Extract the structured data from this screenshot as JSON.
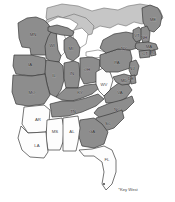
{
  "map": {
    "title": "Eastern United States shaded state map",
    "background_color": "#ffffff",
    "shaded_fill": "#8d8d8d",
    "unshaded_fill": "#fdfdfd",
    "neutral_fill": "#c6c6c6",
    "lake_fill": "#ffffff",
    "border_color": "#3a3a3a",
    "annotations": [
      {
        "id": "key-west",
        "text": "*Key West",
        "x": 128,
        "y": 190
      }
    ],
    "states": [
      {
        "id": "MN",
        "label": "MN",
        "shaded": true,
        "lx": 33,
        "ly": 35
      },
      {
        "id": "WI",
        "label": "WI",
        "shaded": true,
        "lx": 52,
        "ly": 46
      },
      {
        "id": "MI",
        "label": "MI",
        "shaded": true,
        "lx": 71,
        "ly": 49
      },
      {
        "id": "IA",
        "label": "IA",
        "shaded": true,
        "lx": 30,
        "ly": 65
      },
      {
        "id": "IL",
        "label": "IL",
        "shaded": true,
        "lx": 54,
        "ly": 76
      },
      {
        "id": "IN",
        "label": "IN",
        "shaded": true,
        "lx": 72,
        "ly": 74
      },
      {
        "id": "OH",
        "label": "OH",
        "shaded": true,
        "lx": 87,
        "ly": 70
      },
      {
        "id": "MO",
        "label": "MO",
        "shaded": true,
        "lx": 32,
        "ly": 93
      },
      {
        "id": "KY",
        "label": "KY",
        "shaded": true,
        "lx": 80,
        "ly": 93
      },
      {
        "id": "TN",
        "label": "TN",
        "shaded": true,
        "lx": 73,
        "ly": 112
      },
      {
        "id": "WV",
        "label": "WV",
        "shaded": false,
        "lx": 104,
        "ly": 85
      },
      {
        "id": "PA",
        "label": "PA",
        "shaded": true,
        "lx": 117,
        "ly": 63
      },
      {
        "id": "NY",
        "label": "NY",
        "shaded": true,
        "lx": 124,
        "ly": 49
      },
      {
        "id": "VA",
        "label": "VA",
        "shaded": true,
        "lx": 120,
        "ly": 93
      },
      {
        "id": "NC",
        "label": "NC",
        "shaded": true,
        "lx": 117,
        "ly": 110
      },
      {
        "id": "SC",
        "label": "SC",
        "shaded": true,
        "lx": 108,
        "ly": 124
      },
      {
        "id": "GA",
        "label": "GA",
        "shaded": true,
        "lx": 92,
        "ly": 132
      },
      {
        "id": "AR",
        "label": "AR",
        "shaded": false,
        "lx": 38,
        "ly": 120
      },
      {
        "id": "MS",
        "label": "MS",
        "shaded": false,
        "lx": 55,
        "ly": 132
      },
      {
        "id": "AL",
        "label": "AL",
        "shaded": false,
        "lx": 72,
        "ly": 132
      },
      {
        "id": "LA",
        "label": "LA",
        "shaded": false,
        "lx": 37,
        "ly": 146
      },
      {
        "id": "FL",
        "label": "FL",
        "shaded": false,
        "lx": 107,
        "ly": 160
      },
      {
        "id": "ME",
        "label": "ME",
        "shaded": true,
        "lx": 153,
        "ly": 20
      },
      {
        "id": "VT",
        "label": "VT",
        "shaded": true,
        "lx": 137,
        "ly": 36
      },
      {
        "id": "NH",
        "label": "NH",
        "shaded": true,
        "lx": 144,
        "ly": 38
      },
      {
        "id": "MA",
        "label": "MA",
        "shaded": true,
        "lx": 149,
        "ly": 47
      },
      {
        "id": "CT",
        "label": "CT",
        "shaded": true,
        "lx": 145,
        "ly": 54
      },
      {
        "id": "RI",
        "label": "RI",
        "shaded": true,
        "lx": 153,
        "ly": 53
      },
      {
        "id": "NJ",
        "label": "NJ",
        "shaded": true,
        "lx": 132,
        "ly": 69
      },
      {
        "id": "DE",
        "label": "DE",
        "shaded": true,
        "lx": 131,
        "ly": 79
      },
      {
        "id": "MD",
        "label": "MD",
        "shaded": true,
        "lx": 124,
        "ly": 81
      }
    ]
  }
}
